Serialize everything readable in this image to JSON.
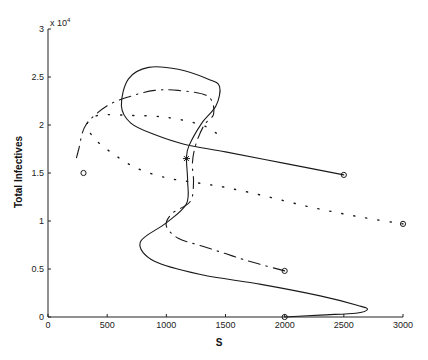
{
  "chart_data": {
    "type": "line",
    "title": "",
    "xlabel": "S",
    "ylabel": "Total Infectives",
    "y_multiplier": "x 10",
    "y_multiplier_exp": "4",
    "xlim": [
      0,
      3000
    ],
    "ylim": [
      0,
      3
    ],
    "grid": false,
    "legend": null,
    "x_ticks": [
      "0",
      "500",
      "1000",
      "1500",
      "2000",
      "2500",
      "3000"
    ],
    "y_ticks": [
      "0",
      "0.5",
      "1",
      "1.5",
      "2",
      "2.5",
      "3"
    ],
    "series": [
      {
        "name": "trajectory-solid",
        "style": "solid",
        "start": {
          "S": 2500,
          "I": 1.48
        },
        "points": [
          [
            2500,
            1.48
          ],
          [
            2000,
            1.6
          ],
          [
            1500,
            1.72
          ],
          [
            1150,
            1.8
          ],
          [
            900,
            1.9
          ],
          [
            700,
            2.02
          ],
          [
            620,
            2.2
          ],
          [
            680,
            2.48
          ],
          [
            850,
            2.6
          ],
          [
            1100,
            2.58
          ],
          [
            1350,
            2.48
          ],
          [
            1450,
            2.4
          ],
          [
            1420,
            2.2
          ],
          [
            1300,
            2.02
          ],
          [
            1190,
            1.78
          ],
          [
            1170,
            1.65
          ],
          [
            1180,
            1.42
          ],
          [
            1170,
            1.18
          ],
          [
            1000,
            0.98
          ],
          [
            780,
            0.78
          ],
          [
            900,
            0.58
          ],
          [
            1300,
            0.44
          ],
          [
            1800,
            0.34
          ],
          [
            2300,
            0.22
          ],
          [
            2620,
            0.12
          ],
          [
            2700,
            0.08
          ],
          [
            2600,
            0.04
          ],
          [
            2300,
            0.02
          ],
          [
            2000,
            0
          ]
        ],
        "end": {
          "S": 2000,
          "I": 0
        }
      },
      {
        "name": "trajectory-dashdot-inner",
        "style": "dashdot",
        "start": {
          "S": 2000,
          "I": 0.48
        },
        "points": [
          [
            2000,
            0.48
          ],
          [
            1700,
            0.58
          ],
          [
            1500,
            0.66
          ],
          [
            1300,
            0.74
          ],
          [
            1100,
            0.82
          ],
          [
            1000,
            0.95
          ],
          [
            1050,
            1.08
          ],
          [
            1200,
            1.2
          ],
          [
            1230,
            1.4
          ],
          [
            1220,
            1.6
          ],
          [
            1250,
            1.8
          ],
          [
            1320,
            2.0
          ],
          [
            1400,
            2.12
          ],
          [
            1350,
            2.3
          ],
          [
            1100,
            2.36
          ],
          [
            900,
            2.36
          ],
          [
            700,
            2.3
          ],
          [
            500,
            2.2
          ],
          [
            320,
            2.0
          ],
          [
            260,
            1.75
          ],
          [
            230,
            1.6
          ]
        ]
      },
      {
        "name": "trajectory-dotted",
        "style": "dotted",
        "start": {
          "S": 3000,
          "I": 0.97
        },
        "points": [
          [
            3000,
            0.97
          ],
          [
            2600,
            1.05
          ],
          [
            2200,
            1.15
          ],
          [
            1800,
            1.27
          ],
          [
            1500,
            1.35
          ],
          [
            1250,
            1.4
          ],
          [
            1000,
            1.45
          ],
          [
            750,
            1.55
          ],
          [
            550,
            1.7
          ],
          [
            400,
            1.85
          ],
          [
            330,
            2.0
          ],
          [
            420,
            2.1
          ],
          [
            700,
            2.1
          ],
          [
            1000,
            2.08
          ],
          [
            1300,
            2.0
          ],
          [
            1440,
            1.9
          ]
        ]
      }
    ],
    "markers": [
      {
        "shape": "circle",
        "S": 2500,
        "I": 1.48
      },
      {
        "shape": "circle",
        "S": 3000,
        "I": 0.97
      },
      {
        "shape": "circle",
        "S": 2000,
        "I": 0.48
      },
      {
        "shape": "circle",
        "S": 300,
        "I": 1.5
      },
      {
        "shape": "circle",
        "S": 2000,
        "I": 0.0
      },
      {
        "shape": "star",
        "S": 1170,
        "I": 1.65
      }
    ]
  }
}
